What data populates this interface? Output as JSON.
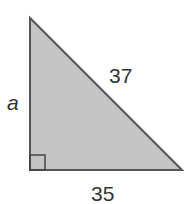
{
  "figure": {
    "type": "right-triangle",
    "labels": {
      "hypotenuse": "37",
      "vertical_leg": "a",
      "horizontal_leg": "35"
    },
    "right_angle_marker": true,
    "colors": {
      "fill": "#c4c4c4",
      "stroke": "#555555",
      "text": "#333333",
      "background": "#ffffff"
    }
  }
}
